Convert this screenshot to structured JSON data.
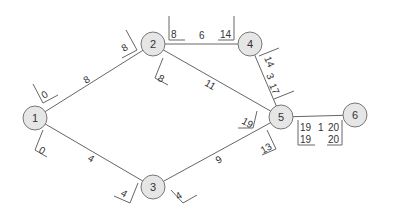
{
  "nodes": [
    {
      "id": "1",
      "x": 35,
      "y": 118
    },
    {
      "id": "2",
      "x": 153,
      "y": 44
    },
    {
      "id": "3",
      "x": 153,
      "y": 187
    },
    {
      "id": "4",
      "x": 250,
      "y": 44
    },
    {
      "id": "5",
      "x": 281,
      "y": 117
    },
    {
      "id": "6",
      "x": 355,
      "y": 115
    }
  ],
  "edges": [
    {
      "from": "1",
      "to": "2",
      "duration": "8",
      "start_early": "0",
      "end_late": "8"
    },
    {
      "from": "1",
      "to": "3",
      "duration": "4",
      "start_early": "0",
      "end_late": "4"
    },
    {
      "from": "2",
      "to": "4",
      "duration": "6",
      "start_early": "8",
      "end_late": "14"
    },
    {
      "from": "2",
      "to": "5",
      "duration": "11",
      "start_early": "8",
      "end_late": "19"
    },
    {
      "from": "3",
      "to": "5",
      "duration": "9",
      "start_early": "4",
      "end_late": "13"
    },
    {
      "from": "4",
      "to": "5",
      "duration": "3",
      "start_early": "14",
      "end_late": "17"
    },
    {
      "from": "5",
      "to": "6",
      "duration": "1",
      "start_early": "19",
      "end_late": "20",
      "start_late": "19",
      "end_early": "20"
    }
  ],
  "colors": {
    "node_fill": "#e6e6e6",
    "stroke": "#666666",
    "text": "#333333"
  }
}
